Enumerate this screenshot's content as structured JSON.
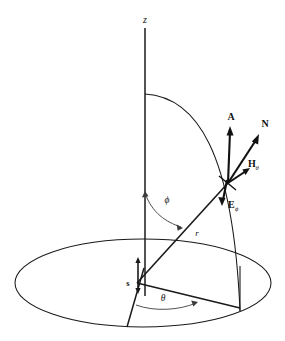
{
  "figure": {
    "kind": "spherical-coordinate-vector-diagram",
    "background_color": "#ffffff",
    "line_color": "#1a1a1a",
    "thin_line_color": "#3c3c3c",
    "labels": {
      "z_axis": "z",
      "source_point": "s",
      "radial_distance": "r",
      "polar_angle": "ϕ",
      "azimuth_angle": "θ",
      "vector_a": "A",
      "vector_n": "N",
      "vector_h": "H",
      "vector_h_subscript": "θ",
      "vector_e": "E",
      "vector_e_subscript": "ϕ"
    },
    "geometry_notes": {
      "base_plane": "ellipse representing the horizontal x-y plane",
      "meridian_arc": "quarter arc from z-axis down to base ellipse",
      "vector_origin": "field point on the meridian arc where A, N, H and E originate"
    }
  }
}
